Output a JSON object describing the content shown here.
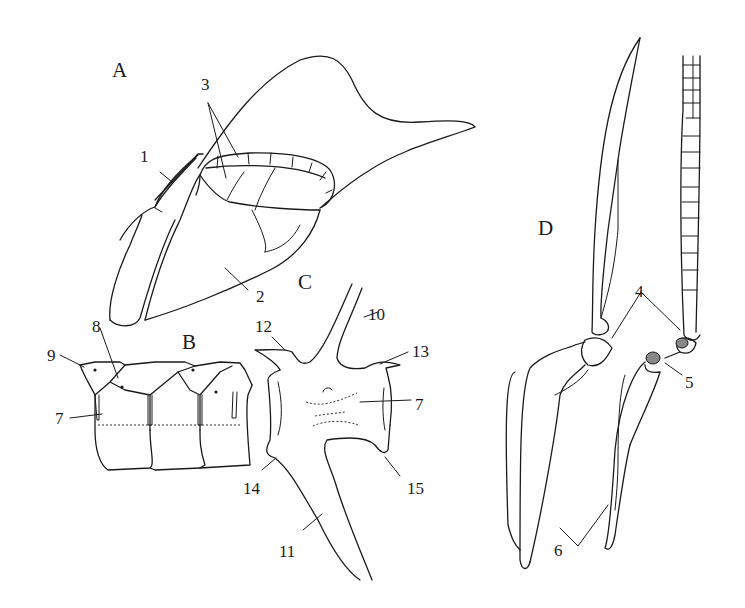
{
  "figure": {
    "panels": [
      {
        "id": "A",
        "label": "A",
        "x": 112,
        "y": 60,
        "description": "Lateral view of pronotum/forewing region showing segmented structures"
      },
      {
        "id": "B",
        "label": "B",
        "x": 182,
        "y": 332,
        "description": "Abdominal segments, lateral view"
      },
      {
        "id": "C",
        "label": "C",
        "x": 298,
        "y": 272,
        "description": "Single abdominal segment sclerite with apodemes"
      },
      {
        "id": "D",
        "label": "D",
        "x": 538,
        "y": 218,
        "description": "Legs with coxa, trochanter and segmented tarsi"
      }
    ],
    "callouts": [
      {
        "id": "1",
        "label": "1",
        "x": 140,
        "y": 148
      },
      {
        "id": "2",
        "label": "2",
        "x": 256,
        "y": 288
      },
      {
        "id": "3",
        "label": "3",
        "x": 201,
        "y": 76
      },
      {
        "id": "4",
        "label": "4",
        "x": 635,
        "y": 283
      },
      {
        "id": "5",
        "label": "5",
        "x": 685,
        "y": 374
      },
      {
        "id": "6",
        "label": "6",
        "x": 554,
        "y": 542
      },
      {
        "id": "7a",
        "label": "7",
        "x": 55,
        "y": 410
      },
      {
        "id": "7b",
        "label": "7",
        "x": 415,
        "y": 396
      },
      {
        "id": "8",
        "label": "8",
        "x": 92,
        "y": 318
      },
      {
        "id": "9",
        "label": "9",
        "x": 47,
        "y": 347
      },
      {
        "id": "10",
        "label": "10",
        "x": 368,
        "y": 306
      },
      {
        "id": "11",
        "label": "11",
        "x": 279,
        "y": 543
      },
      {
        "id": "12",
        "label": "12",
        "x": 255,
        "y": 318
      },
      {
        "id": "13",
        "label": "13",
        "x": 412,
        "y": 343
      },
      {
        "id": "14",
        "label": "14",
        "x": 243,
        "y": 480
      },
      {
        "id": "15",
        "label": "15",
        "x": 407,
        "y": 480
      }
    ]
  }
}
